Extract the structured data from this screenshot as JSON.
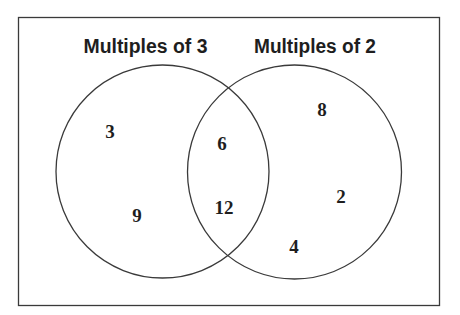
{
  "diagram": {
    "type": "venn",
    "sets": [
      {
        "name": "Multiples of 3",
        "only_members": [
          "3",
          "9"
        ]
      },
      {
        "name": "Multiples of 2",
        "only_members": [
          "8",
          "2",
          "4"
        ]
      }
    ],
    "intersection": [
      "6",
      "12"
    ],
    "labels": {
      "left": "Multiples of 3",
      "right": "Multiples of 2"
    },
    "numbers": {
      "left_only": [
        "3",
        "9"
      ],
      "both": [
        "6",
        "12"
      ],
      "right_only": [
        "8",
        "2",
        "4"
      ]
    },
    "colors": {
      "stroke": "#3a3a3a",
      "text": "#1e1e1e",
      "background": "#ffffff"
    }
  }
}
